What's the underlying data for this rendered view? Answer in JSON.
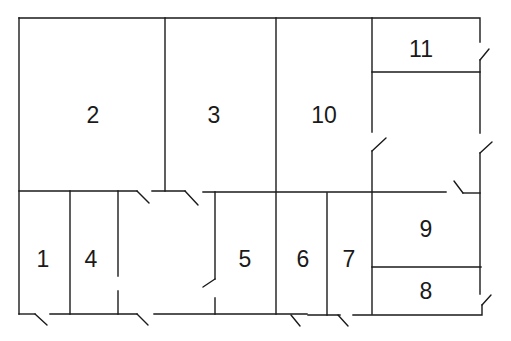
{
  "diagram": {
    "type": "floor-plan",
    "colors": {
      "line": "#1a1a1a",
      "background": "#ffffff"
    },
    "rooms": [
      {
        "id": "room-1",
        "label": "1",
        "x": 43,
        "y": 259
      },
      {
        "id": "room-2",
        "label": "2",
        "x": 93,
        "y": 115
      },
      {
        "id": "room-3",
        "label": "3",
        "x": 214,
        "y": 115
      },
      {
        "id": "room-4",
        "label": "4",
        "x": 91,
        "y": 259
      },
      {
        "id": "room-5",
        "label": "5",
        "x": 245,
        "y": 259
      },
      {
        "id": "room-6",
        "label": "6",
        "x": 303,
        "y": 259
      },
      {
        "id": "room-7",
        "label": "7",
        "x": 349,
        "y": 259
      },
      {
        "id": "room-8",
        "label": "8",
        "x": 426,
        "y": 291
      },
      {
        "id": "room-9",
        "label": "9",
        "x": 426,
        "y": 229
      },
      {
        "id": "room-10",
        "label": "10",
        "x": 324,
        "y": 115
      },
      {
        "id": "room-11",
        "label": "11",
        "x": 421,
        "y": 49
      }
    ]
  }
}
